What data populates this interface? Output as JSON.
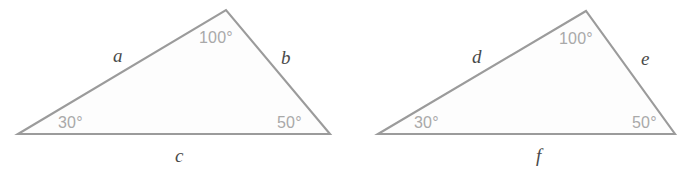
{
  "figure": {
    "background_color": "#ffffff",
    "stroke_color": "#9b9b9b",
    "fill_color": "#fdfdfd",
    "side_label_color": "#4a4a4a",
    "angle_label_color": "#a9a9a9"
  },
  "triangles": [
    {
      "id": "left-triangle",
      "name": "triangle-abc",
      "vertices": {
        "left": {
          "x": 18,
          "y": 134
        },
        "apex": {
          "x": 226,
          "y": 10
        },
        "right": {
          "x": 330,
          "y": 134
        }
      },
      "angles": [
        {
          "key": "left",
          "value": "30°",
          "x": 58,
          "y": 115
        },
        {
          "key": "apex",
          "value": "100°",
          "x": 199,
          "y": 30
        },
        {
          "key": "right",
          "value": "50°",
          "x": 277,
          "y": 115
        }
      ],
      "sides": [
        {
          "key": "upper-left",
          "value": "a",
          "x": 113,
          "y": 46
        },
        {
          "key": "right",
          "value": "b",
          "x": 281,
          "y": 48
        },
        {
          "key": "base",
          "value": "c",
          "x": 175,
          "y": 146
        }
      ]
    },
    {
      "id": "right-triangle",
      "name": "triangle-def",
      "vertices": {
        "left": {
          "x": 378,
          "y": 134
        },
        "apex": {
          "x": 586,
          "y": 11
        },
        "right": {
          "x": 675,
          "y": 134
        }
      },
      "angles": [
        {
          "key": "left",
          "value": "30°",
          "x": 414,
          "y": 115
        },
        {
          "key": "apex",
          "value": "100°",
          "x": 559,
          "y": 31
        },
        {
          "key": "right",
          "value": "50°",
          "x": 632,
          "y": 115
        }
      ],
      "sides": [
        {
          "key": "upper-left",
          "value": "d",
          "x": 472,
          "y": 47
        },
        {
          "key": "right",
          "value": "e",
          "x": 641,
          "y": 49
        },
        {
          "key": "base",
          "value": "f",
          "x": 536,
          "y": 146
        }
      ]
    }
  ]
}
